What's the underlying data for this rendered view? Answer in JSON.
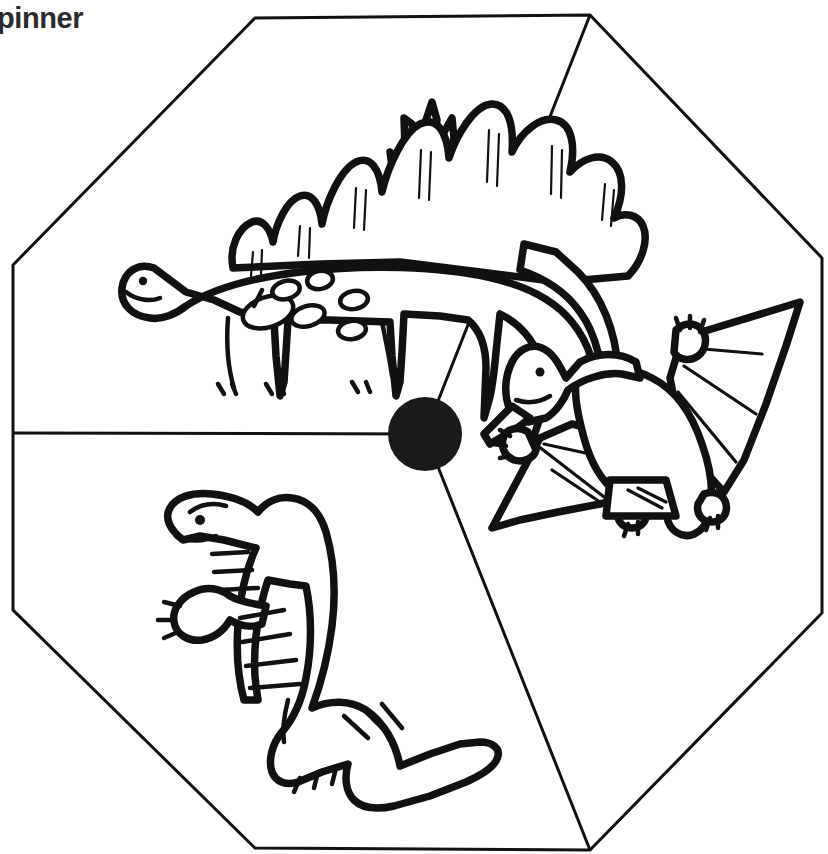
{
  "page": {
    "title_text": "pinner",
    "background_color": "#ffffff",
    "ink_color": "#111111",
    "title_color": "#2b2b2b"
  },
  "spinner": {
    "shape": "octagon",
    "section_count": 3,
    "hub": {
      "label": "spinner-hub",
      "center_x": 425,
      "center_y": 434,
      "radius": 37,
      "color": "#1a1a1a"
    },
    "outline_points": "255,18 590,15 822,258 822,613 590,850 255,848 13,610 13,265",
    "dividers": [
      {
        "label": "divider-left",
        "from_x": 425,
        "from_y": 434,
        "to_x": 13,
        "to_y": 433
      },
      {
        "label": "divider-upper-right",
        "from_x": 425,
        "from_y": 434,
        "to_x": 590,
        "to_y": 15
      },
      {
        "label": "divider-lower-right",
        "from_x": 425,
        "from_y": 434,
        "to_x": 590,
        "to_y": 850
      }
    ],
    "sections": [
      {
        "id": "section-stegosaurus",
        "label": "Stegosaurus",
        "position": "top-left"
      },
      {
        "id": "section-pterodactyl",
        "label": "Pterodactyl",
        "position": "right"
      },
      {
        "id": "section-tyrannosaurus",
        "label": "Tyrannosaurus",
        "position": "bottom-left"
      }
    ]
  }
}
